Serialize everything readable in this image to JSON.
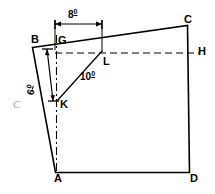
{
  "figure": {
    "marker": "C",
    "vertices": [
      {
        "id": "B",
        "label": "B",
        "x": 31,
        "y": 40
      },
      {
        "id": "C",
        "label": "C",
        "x": 190,
        "y": 20
      },
      {
        "id": "D",
        "label": "D",
        "x": 196,
        "y": 180
      },
      {
        "id": "A",
        "label": "A",
        "x": 58,
        "y": 180
      },
      {
        "id": "G",
        "label": "G",
        "x": 60,
        "y": 40
      },
      {
        "id": "H",
        "label": "H",
        "x": 197,
        "y": 47
      },
      {
        "id": "K",
        "label": "K",
        "x": 63,
        "y": 106
      },
      {
        "id": "L",
        "label": "L",
        "x": 106,
        "y": 57
      }
    ],
    "dimensions": [
      {
        "id": "top",
        "value": "8",
        "unit": "0",
        "x": 70,
        "y": 10
      },
      {
        "id": "vertical",
        "value": "6",
        "unit": "0",
        "x": 35,
        "y": 78
      },
      {
        "id": "diagonal",
        "value": "10",
        "unit": "0",
        "x": 82,
        "y": 72
      }
    ],
    "geometry": {
      "outline": "M 32.5,47.5 L 187.5,25.5 L 189.5,172.5 L 55.5,172.5 Z",
      "dashed_horizontal": {
        "x1": 55,
        "y1": 53,
        "x2": 199,
        "y2": 53
      },
      "dashed_vertical": {
        "x1": 56.5,
        "y1": 35,
        "x2": 56.5,
        "y2": 172
      },
      "diagonal_kl": {
        "x1": 57,
        "y1": 101,
        "x2": 102,
        "y2": 51
      },
      "dim_top_line": {
        "x1": 55,
        "y1": 24,
        "x2": 102,
        "y2": 24
      },
      "dim_left_line": {
        "x1": 46,
        "y1": 48,
        "x2": 53,
        "y2": 101
      },
      "ext_g_top": {
        "x1": 55,
        "y1": 20,
        "x2": 55,
        "y2": 50
      },
      "ext_l_top": {
        "x1": 102,
        "y1": 20,
        "x2": 102,
        "y2": 52
      }
    },
    "colors": {
      "stroke": "#000000",
      "marker": "#9a9a9a",
      "background": "#ffffff"
    }
  }
}
